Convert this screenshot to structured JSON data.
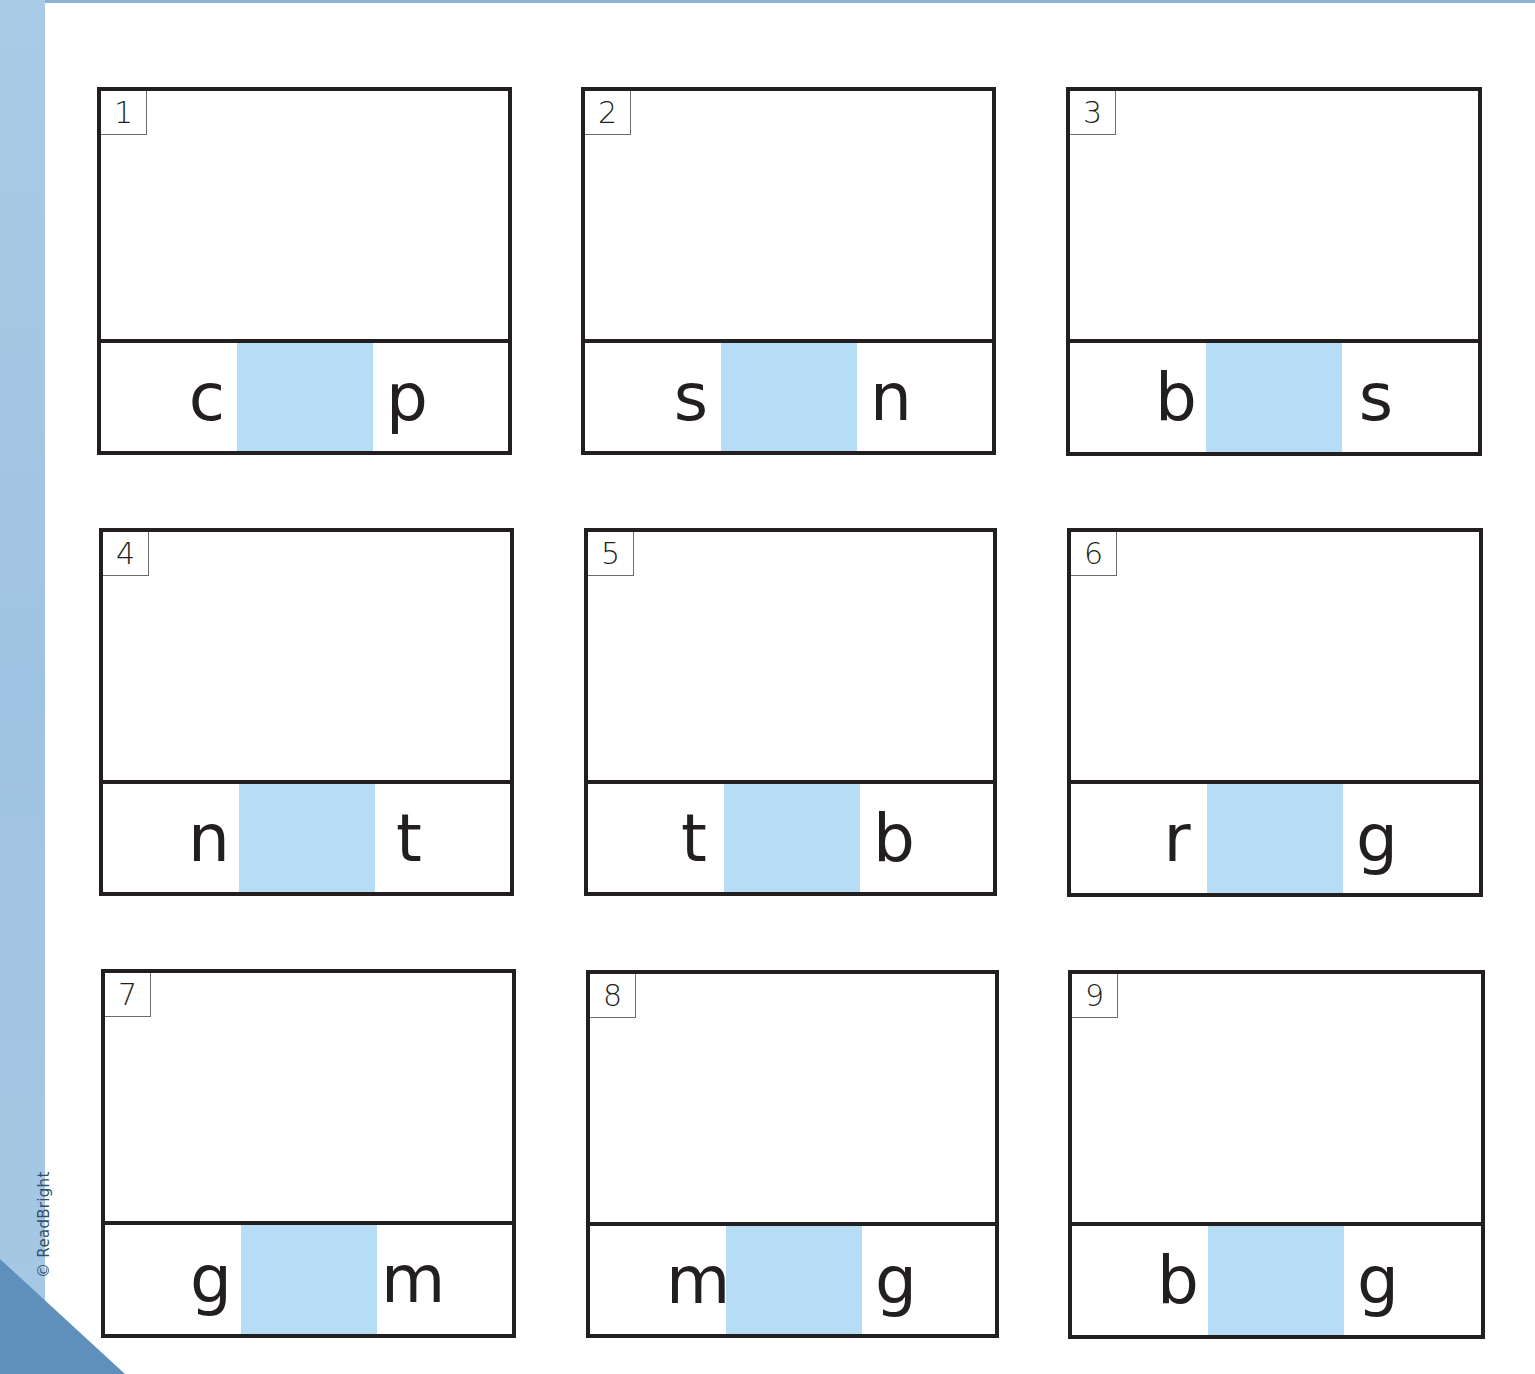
{
  "page": {
    "background": "#ffffff",
    "accent_band_color": "#a9cbe6",
    "corner_color": "#5f90bb",
    "blank_fill_color": "#b6ddf5",
    "copyright": "© ReadBright"
  },
  "worksheet": {
    "type": "CVC word building - fill in missing vowel",
    "cards": [
      {
        "number": "1",
        "first": "c",
        "blank": "",
        "last": "p"
      },
      {
        "number": "2",
        "first": "s",
        "blank": "",
        "last": "n"
      },
      {
        "number": "3",
        "first": "b",
        "blank": "",
        "last": "s"
      },
      {
        "number": "4",
        "first": "n",
        "blank": "",
        "last": "t"
      },
      {
        "number": "5",
        "first": "t",
        "blank": "",
        "last": "b"
      },
      {
        "number": "6",
        "first": "r",
        "blank": "",
        "last": "g"
      },
      {
        "number": "7",
        "first": "g",
        "blank": "",
        "last": "m"
      },
      {
        "number": "8",
        "first": "m",
        "blank": "",
        "last": "g"
      },
      {
        "number": "9",
        "first": "b",
        "blank": "",
        "last": "g"
      }
    ]
  }
}
